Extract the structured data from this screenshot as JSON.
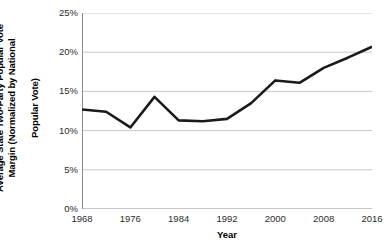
{
  "chart_data": {
    "type": "line",
    "title": "",
    "subtitle": "",
    "xlabel": "Year",
    "ylabel": "Average State Two-Party Popular Vote Margin (Normalized by National Popular Vote)",
    "ylabel_line1": "Average State Two-Party Popular Vote",
    "ylabel_line2": "Margin (Normalized by National",
    "ylabel_line3": "Popular Vote)",
    "x": [
      1968,
      1972,
      1976,
      1980,
      1984,
      1988,
      1992,
      1996,
      2000,
      2004,
      2008,
      2012,
      2016
    ],
    "values": [
      12.7,
      12.4,
      10.4,
      14.3,
      11.3,
      11.2,
      11.5,
      13.5,
      16.4,
      16.1,
      18.0,
      19.3,
      20.7
    ],
    "categories": [
      "1968",
      "1972",
      "1976",
      "1980",
      "1984",
      "1988",
      "1992",
      "1996",
      "2000",
      "2004",
      "2008",
      "2012",
      "2016"
    ],
    "series": [
      {
        "name": "Average State Two-Party Popular Vote Margin",
        "values": [
          12.7,
          12.4,
          10.4,
          14.3,
          11.3,
          11.2,
          11.5,
          13.5,
          16.4,
          16.1,
          18.0,
          19.3,
          20.7
        ]
      }
    ],
    "xlim": [
      1968,
      2016
    ],
    "ylim": [
      0,
      25
    ],
    "x_ticks": [
      1968,
      1976,
      1984,
      1992,
      2000,
      2008,
      2016
    ],
    "x_tick_labels": [
      "1968",
      "1976",
      "1984",
      "1992",
      "2000",
      "2008",
      "2016"
    ],
    "y_ticks": [
      0,
      5,
      10,
      15,
      20,
      25
    ],
    "y_tick_labels": [
      "0%",
      "5%",
      "10%",
      "15%",
      "20%",
      "25%"
    ],
    "grid": "horizontal",
    "legend": "none",
    "line_color": "#1a1a1a",
    "grid_color": "#c8c8c8",
    "axis_color": "#8c8c8c",
    "background_color": "#ffffff",
    "line_width": 2.6,
    "markers": false
  }
}
